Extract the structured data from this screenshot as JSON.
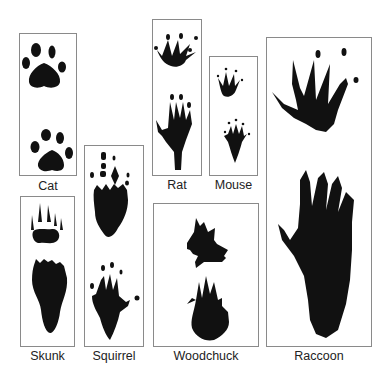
{
  "animals": [
    {
      "name": "Cat"
    },
    {
      "name": "Skunk"
    },
    {
      "name": "Squirrel"
    },
    {
      "name": "Rat"
    },
    {
      "name": "Mouse"
    },
    {
      "name": "Woodchuck"
    },
    {
      "name": "Raccoon"
    }
  ],
  "colors": {
    "ink": "#111111",
    "border": "#8a8a8a",
    "background": "#ffffff"
  }
}
